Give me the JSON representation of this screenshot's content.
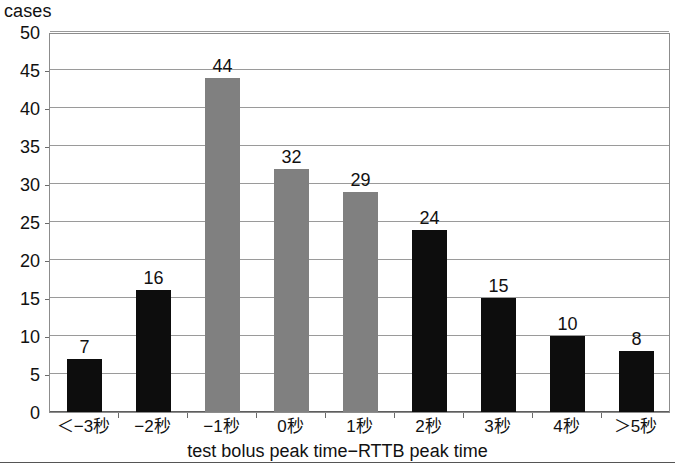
{
  "figure": {
    "yaxis_caption": "cases",
    "xaxis_title": "test bolus peak time−RTTB peak time",
    "bottom_rule": true
  },
  "colors": {
    "bar_dark": "#0d0d0d",
    "bar_gray": "#808080",
    "gridline": "#9a9a9a",
    "frame": "#8c8c8c",
    "text": "#111111"
  },
  "chart_data": {
    "type": "bar",
    "title": "",
    "subtitle": "",
    "xlabel": "test bolus peak time−RTTB peak time",
    "ylabel": "cases",
    "categories": [
      "＜−3秒",
      "−2秒",
      "−1秒",
      "0秒",
      "1秒",
      "2秒",
      "3秒",
      "4秒",
      "＞5秒"
    ],
    "values": [
      7,
      16,
      44,
      32,
      29,
      24,
      15,
      10,
      8
    ],
    "bar_colors": [
      "#0d0d0d",
      "#0d0d0d",
      "#808080",
      "#808080",
      "#808080",
      "#0d0d0d",
      "#0d0d0d",
      "#0d0d0d",
      "#0d0d0d"
    ],
    "data_labels": [
      "7",
      "16",
      "44",
      "32",
      "29",
      "24",
      "15",
      "10",
      "8"
    ],
    "ylim": [
      0,
      50
    ],
    "ytick_step": 5,
    "yticks": [
      0,
      5,
      10,
      15,
      20,
      25,
      30,
      35,
      40,
      45,
      50
    ],
    "ytick_labels": [
      "0",
      "5",
      "10",
      "15",
      "20",
      "25",
      "30",
      "35",
      "40",
      "45",
      "50"
    ],
    "grid": true,
    "grid_axis": "y",
    "legend": null,
    "legend_position": "none"
  }
}
